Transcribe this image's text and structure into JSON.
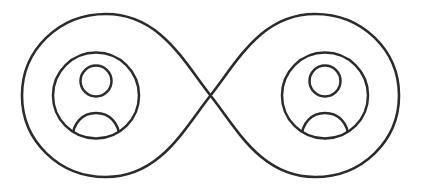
{
  "canvas": {
    "width": 421,
    "height": 191,
    "background_color": "#ffffff",
    "title": "Infinity Loop with Two Person Avatars"
  },
  "style": {
    "stroke_color": "#2b2b2b",
    "stroke_width": 2.6,
    "avatar_stroke_width": 2.5,
    "fill": "none"
  },
  "graphic": {
    "name": "infinity-two-people-icon",
    "description": "Continuous lemniscate (infinity symbol) outline whose two lobes each enclose a circular user-avatar glyph",
    "center": {
      "x": 210.5,
      "y": 95.5
    },
    "crossing_point": {
      "x": 210.5,
      "y": 95.5
    },
    "bounds": {
      "left": 22,
      "right": 399,
      "top": 14,
      "bottom": 177
    }
  },
  "infinity": {
    "path": "M 210.5 95.5 C 184 62 160 14 106 14 C 59 14 22 50 22 95.5 C 22 141 59 177 106 177 C 160 177 184 129 210.5 95.5 C 237 62 261 14 315 14 C 362 14 399 50 399 95.5 C 399 141 362 177 315 177 C 261 177 237 129 210.5 95.5 Z"
  },
  "avatars": [
    {
      "id": "avatar-left",
      "label": "left-person-avatar",
      "circle": {
        "cx": 96,
        "cy": 95.5,
        "r": 43
      },
      "head": {
        "cx": 96,
        "cy": 81,
        "r": 15.5
      },
      "shoulders": {
        "path": "M 72.5 139 C 72.5 122.5 83 113 96 113 C 109 113 119.5 122.5 119.5 139",
        "clip_circle": {
          "cx": 96,
          "cy": 95.5,
          "r": 43
        }
      }
    },
    {
      "id": "avatar-right",
      "label": "right-person-avatar",
      "circle": {
        "cx": 325,
        "cy": 95.5,
        "r": 43
      },
      "head": {
        "cx": 325,
        "cy": 81,
        "r": 15.5
      },
      "shoulders": {
        "path": "M 301.5 139 C 301.5 122.5 312 113 325 113 C 338 113 348.5 122.5 348.5 139",
        "clip_circle": {
          "cx": 325,
          "cy": 95.5,
          "r": 43
        }
      }
    }
  ]
}
